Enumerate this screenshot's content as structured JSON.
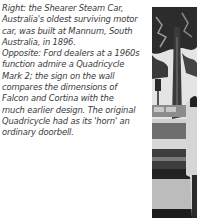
{
  "caption": {
    "lines": [
      "Right: the Shearer Steam Car,",
      "Australia's oldest surviving motor",
      "car, was built at Mannum, South",
      "Australia, in 1896.",
      "Opposite: Ford dealers at a 1960s",
      "function admire a Quadricycle",
      "Mark 2; the sign on the wall",
      "compares the dimensions of",
      "Falcon and Cortina with the",
      "much earlier design. The original",
      "Quadricycle had as its 'horn' an",
      "ordinary doorbell."
    ]
  },
  "photo": {
    "description": "black-and-white photograph: tree, street, building and person",
    "colors": {
      "sky": "#e6e6e6",
      "foliage": "#2a2a2a",
      "trunk": "#3c3c3c",
      "road": "#b8b8b8",
      "dark": "#1a1a1a",
      "figure": "#d0d0d0"
    }
  }
}
